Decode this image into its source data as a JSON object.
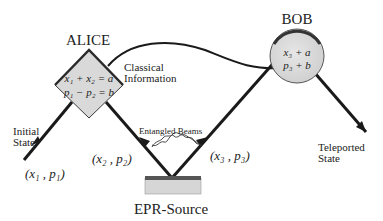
{
  "nodes": {
    "alice": {
      "label": "ALICE",
      "eq1": "x₁ + x₂ = a",
      "eq2": "p₁ − p₂ = b"
    },
    "bob": {
      "label": "BOB",
      "eq1": "x₃ + a",
      "eq2": "p₃ + b"
    },
    "epr": {
      "label": "EPR-Source"
    }
  },
  "labels": {
    "classical_1": "Classical",
    "classical_2": "Information",
    "initial_1": "Initial",
    "initial_2": "State",
    "teleported_1": "Teleported",
    "teleported_2": "State",
    "entangled": "Entangled Beams",
    "mode1": "(x₁ , p₁)",
    "mode2": "(x₂ , p₂)",
    "mode3": "(x₃ , p₃)"
  },
  "colors": {
    "line": "#1a1a1a",
    "node_fill": "#d9d9d9",
    "node_edge": "#3a3a3a",
    "epr_top": "#555555"
  }
}
